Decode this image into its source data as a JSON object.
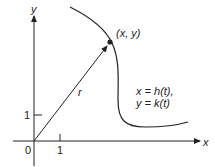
{
  "diagram": {
    "axes": {
      "x_label": "x",
      "y_label": "y",
      "origin_label": "0",
      "x_tick_label": "1",
      "y_tick_label": "1"
    },
    "point_label": "(x, y)",
    "vector_label": "r",
    "equations": {
      "line1": "x = h(t),",
      "line2": "y = k(t)"
    },
    "colors": {
      "ink": "#222222",
      "background": "#ffffff"
    }
  }
}
